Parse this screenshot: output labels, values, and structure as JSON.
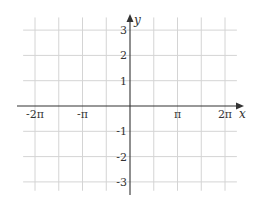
{
  "chart_data": {
    "type": "line",
    "title": "",
    "xlabel": "x",
    "ylabel": "y",
    "xlim": [
      -6.9,
      7.6
    ],
    "ylim": [
      -3.4,
      3.8
    ],
    "grid": true,
    "x_grid_step_pi": 0.5,
    "x_ticks": [
      {
        "value_pi": -2,
        "label": "-2π"
      },
      {
        "value_pi": -1,
        "label": "-π"
      },
      {
        "value_pi": 1,
        "label": "π"
      },
      {
        "value_pi": 2,
        "label": "2π"
      }
    ],
    "y_ticks": [
      {
        "value": 3,
        "label": "3"
      },
      {
        "value": 2,
        "label": "2"
      },
      {
        "value": 1,
        "label": "1"
      },
      {
        "value": -1,
        "label": "-1"
      },
      {
        "value": -2,
        "label": "-2"
      },
      {
        "value": -3,
        "label": "-3"
      }
    ],
    "grid_x_range_pi": [
      -2.25,
      2.25
    ],
    "grid_y_range": [
      -3.35,
      3.5
    ],
    "series": []
  }
}
